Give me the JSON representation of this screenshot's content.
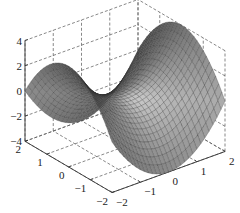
{
  "chart_data": {
    "type": "surface3d",
    "title": "",
    "function": "z = x^2 - y^2",
    "x": {
      "label": "",
      "range": [
        -2,
        2
      ],
      "ticks": [
        -2,
        -1,
        0,
        1,
        2
      ]
    },
    "y": {
      "label": "",
      "range": [
        -2,
        2
      ],
      "ticks": [
        -2,
        -1,
        0,
        1,
        2
      ]
    },
    "z": {
      "label": "",
      "range": [
        -4,
        4
      ],
      "ticks": [
        -4,
        -2,
        0,
        2,
        4
      ]
    },
    "grid": true,
    "grid_style": "dashed",
    "colormap": "gray",
    "mesh_resolution": 28,
    "legend": null
  },
  "projection": {
    "origin": [
      125,
      96
    ],
    "ex": [
      28.25,
      -10.25
    ],
    "ey": [
      -21.75,
      -12.8
    ],
    "ez": [
      0,
      -12.6
    ]
  },
  "colors": {
    "axis": "#333333",
    "grid": "#555555",
    "mesh_edge": "#2a2a2a",
    "background": "#ffffff"
  }
}
